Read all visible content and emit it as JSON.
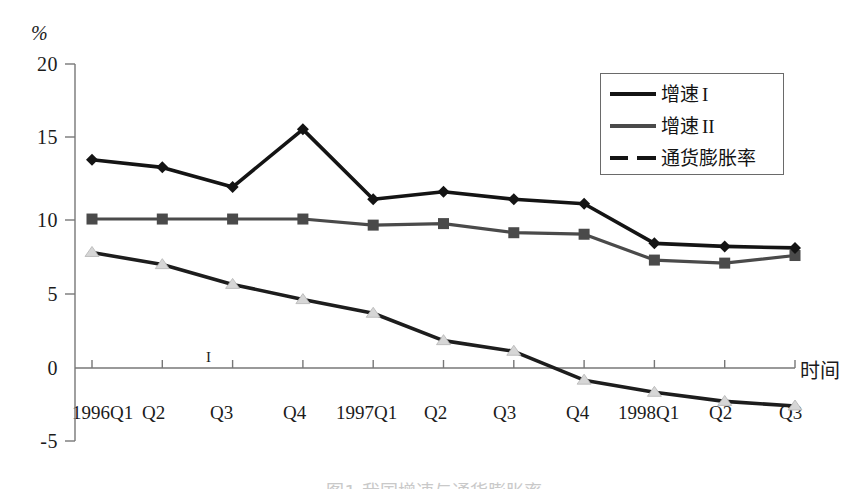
{
  "axes": {
    "y_unit_label": "%",
    "y_ticks": [
      "20",
      "15",
      "10",
      "5",
      "0",
      "-5"
    ],
    "x_axis_name": "时间",
    "x_ticks": [
      "1996Q1",
      "Q2",
      "Q3",
      "Q4",
      "1997Q1",
      "Q2",
      "Q3",
      "Q4",
      "1998Q1",
      "Q2",
      "Q3"
    ],
    "inner_mark": "I"
  },
  "legend": {
    "items": [
      {
        "label": "增速",
        "roman": "I",
        "marker": "diamond",
        "style": "solid-dark"
      },
      {
        "label": "增速",
        "roman": "II",
        "marker": "square",
        "style": "solid-gray"
      },
      {
        "label": "通货膨胀率",
        "roman": "",
        "marker": "triangle",
        "style": "dashed"
      }
    ]
  },
  "caption": {
    "text": "图1  我国增速与通货膨胀率"
  },
  "colors": {
    "series1": "#141414",
    "series2": "#4a4a4a",
    "series3": "#1d1d1d",
    "axis": "#777777",
    "text": "#1b1b1b"
  },
  "chart_data": {
    "type": "line",
    "title": "",
    "xlabel": "时间",
    "ylabel": "%",
    "ylim": [
      -5,
      20
    ],
    "ytick_step": 5,
    "grid": false,
    "legend_position": "top-right",
    "categories": [
      "1996Q1",
      "Q2",
      "Q3",
      "Q4",
      "1997Q1",
      "Q2",
      "Q3",
      "Q4",
      "1998Q1",
      "Q2",
      "Q3"
    ],
    "series": [
      {
        "name": "增速 I",
        "marker": "diamond",
        "linestyle": "solid",
        "color": "#141414",
        "values": [
          13.7,
          13.2,
          11.9,
          15.7,
          11.1,
          11.6,
          11.1,
          10.8,
          8.2,
          8.0,
          7.9
        ]
      },
      {
        "name": "增速 II",
        "marker": "square",
        "linestyle": "solid",
        "color": "#4a4a4a",
        "values": [
          9.8,
          9.8,
          9.8,
          9.8,
          9.4,
          9.5,
          8.9,
          8.8,
          7.1,
          6.9,
          7.4
        ]
      },
      {
        "name": "通货膨胀率",
        "marker": "triangle",
        "linestyle": "dashed",
        "color": "#1d1d1d",
        "values": [
          7.6,
          6.8,
          5.5,
          4.5,
          3.6,
          1.8,
          1.1,
          -0.8,
          -1.6,
          -2.2,
          -2.5
        ]
      }
    ]
  }
}
